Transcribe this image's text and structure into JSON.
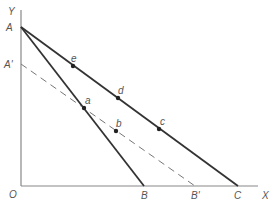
{
  "diagram": {
    "axes": {
      "origin_label": "O",
      "x_label": "X",
      "y_label": "Y",
      "color": "#888888"
    },
    "points": {
      "A": {
        "label": "A",
        "x": 21,
        "y": 27
      },
      "A_prime": {
        "label": "A'",
        "x": 21,
        "y": 64
      },
      "B": {
        "label": "B",
        "x": 144,
        "y": 186
      },
      "B_prime": {
        "label": "B'",
        "x": 195,
        "y": 186
      },
      "C": {
        "label": "C",
        "x": 238,
        "y": 186
      }
    },
    "lines": [
      {
        "name": "AB",
        "from": "A",
        "to": "B",
        "style": "solid",
        "color": "#333333"
      },
      {
        "name": "AC",
        "from": "A",
        "to": "C",
        "style": "solid",
        "color": "#333333"
      },
      {
        "name": "A'B'",
        "from": "A'",
        "to": "B'",
        "style": "dashed",
        "color": "#777777"
      }
    ],
    "markers": [
      {
        "label": "a",
        "x": 84,
        "y": 108
      },
      {
        "label": "b",
        "x": 116,
        "y": 131
      },
      {
        "label": "c",
        "x": 159,
        "y": 129
      },
      {
        "label": "d",
        "x": 118,
        "y": 98
      },
      {
        "label": "e",
        "x": 73,
        "y": 66
      }
    ]
  }
}
